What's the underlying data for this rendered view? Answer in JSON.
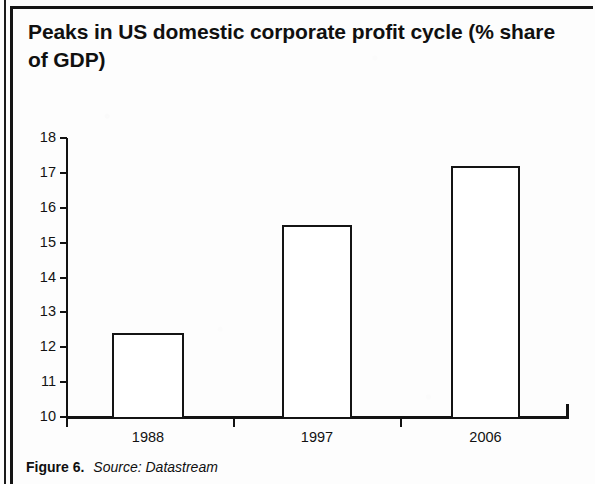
{
  "figure": {
    "title": "Peaks in US domestic corporate profit cycle (% share of GDP)",
    "caption_label": "Figure 6.",
    "caption_source": "Source: Datastream"
  },
  "chart_data": {
    "type": "bar",
    "title": "Peaks in US domestic corporate profit cycle (% share of GDP)",
    "categories": [
      "1988",
      "1997",
      "2006"
    ],
    "values": [
      12.4,
      15.5,
      17.2
    ],
    "xlabel": "",
    "ylabel": "",
    "ylim": [
      10,
      18
    ],
    "ytick_labels": [
      "10",
      "11",
      "12",
      "13",
      "14",
      "15",
      "16",
      "17",
      "18"
    ],
    "ytick_values": [
      10,
      11,
      12,
      13,
      14,
      15,
      16,
      17,
      18
    ],
    "grid": false,
    "legend": false,
    "bar_style": "outlined-hollow",
    "series": [
      {
        "name": "US domestic corporate profit (% share of GDP)",
        "values": [
          12.4,
          15.5,
          17.2
        ]
      }
    ]
  },
  "colors": {
    "ink": "#141414",
    "page": "#fdfdfd",
    "bar_fill": "#ffffff"
  }
}
